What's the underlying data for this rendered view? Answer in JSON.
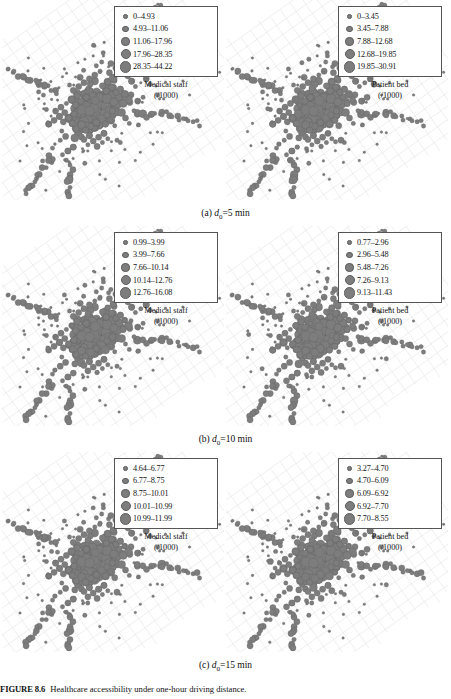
{
  "figure": {
    "number_label": "FIGURE 8.6",
    "caption_text": "Healthcare accessibility under one-hour driving distance.",
    "panel_rows": [
      {
        "subcaption_prefix": "(a)",
        "subcaption_var": "d",
        "subcaption_sub": "0",
        "subcaption_value": "=5 min",
        "panels": [
          {
            "variable": "Medical staff",
            "unit": "(/1000)",
            "classes": [
              {
                "label": "0–4.93",
                "size": 2.6
              },
              {
                "label": "4.93–11.06",
                "size": 4.4
              },
              {
                "label": "11.06–17.96",
                "size": 6.2
              },
              {
                "label": "17.96–28.35",
                "size": 8.0
              },
              {
                "label": "28.35–44.22",
                "size": 9.8
              }
            ]
          },
          {
            "variable": "Patient bed",
            "unit": "(/1000)",
            "classes": [
              {
                "label": "0–3.45",
                "size": 2.6
              },
              {
                "label": "3.45–7.88",
                "size": 4.4
              },
              {
                "label": "7.88–12.68",
                "size": 6.2
              },
              {
                "label": "12.68–19.85",
                "size": 8.0
              },
              {
                "label": "19.85–30.91",
                "size": 9.8
              }
            ]
          }
        ]
      },
      {
        "subcaption_prefix": "(b)",
        "subcaption_var": "d",
        "subcaption_sub": "0",
        "subcaption_value": "=10 min",
        "panels": [
          {
            "variable": "Medical staff",
            "unit": "(/1000)",
            "classes": [
              {
                "label": "0.99–3.99",
                "size": 2.6
              },
              {
                "label": "3.99–7.66",
                "size": 4.4
              },
              {
                "label": "7.66–10.14",
                "size": 6.2
              },
              {
                "label": "10.14–12.76",
                "size": 8.0
              },
              {
                "label": "12.76–16.08",
                "size": 9.8
              }
            ]
          },
          {
            "variable": "Patient bed",
            "unit": "(/1000)",
            "classes": [
              {
                "label": "0.77–2.96",
                "size": 2.6
              },
              {
                "label": "2.96–5.48",
                "size": 4.4
              },
              {
                "label": "5.48–7.26",
                "size": 6.2
              },
              {
                "label": "7.26–9.13",
                "size": 8.0
              },
              {
                "label": "9.13–11.43",
                "size": 9.8
              }
            ]
          }
        ]
      },
      {
        "subcaption_prefix": "(c)",
        "subcaption_var": "d",
        "subcaption_sub": "0",
        "subcaption_value": "=15 min",
        "panels": [
          {
            "variable": "Medical staff",
            "unit": "(/1000)",
            "classes": [
              {
                "label": "4.64–6.77",
                "size": 2.6
              },
              {
                "label": "6.77–8.75",
                "size": 4.4
              },
              {
                "label": "8.75–10.01",
                "size": 6.2
              },
              {
                "label": "10.01–10.99",
                "size": 8.0
              },
              {
                "label": "10.99–11.99",
                "size": 9.8
              }
            ]
          },
          {
            "variable": "Patient bed",
            "unit": "(/1000)",
            "classes": [
              {
                "label": "3.27–4.70",
                "size": 2.6
              },
              {
                "label": "4.70–6.09",
                "size": 4.4
              },
              {
                "label": "6.09–6.92",
                "size": 6.2
              },
              {
                "label": "6.92–7.70",
                "size": 8.0
              },
              {
                "label": "7.70–8.55",
                "size": 9.8
              }
            ]
          }
        ]
      }
    ]
  },
  "chart_data": {
    "type": "scatter",
    "title": "Healthcare accessibility under one-hour driving distance.",
    "xlabel": "",
    "ylabel": "",
    "grid": false,
    "legend_position": "top-right inside panel",
    "marker_color": "#7d7d7d",
    "basemap_color": "#d7d7d7",
    "symbol_sizes_px": [
      2.6,
      4.4,
      6.2,
      8.0,
      9.8
    ],
    "panels": [
      {
        "row": "(a) d0=5 min",
        "column": "Medical staff",
        "series_name": "Medical staff (/1000)",
        "class_breaks": [
          0,
          4.93,
          11.06,
          17.96,
          28.35,
          44.22
        ],
        "class_labels": [
          "0–4.93",
          "4.93–11.06",
          "11.06–17.96",
          "17.96–28.35",
          "28.35–44.22"
        ]
      },
      {
        "row": "(a) d0=5 min",
        "column": "Patient bed",
        "series_name": "Patient bed (/1000)",
        "class_breaks": [
          0,
          3.45,
          7.88,
          12.68,
          19.85,
          30.91
        ],
        "class_labels": [
          "0–3.45",
          "3.45–7.88",
          "7.88–12.68",
          "12.68–19.85",
          "19.85–30.91"
        ]
      },
      {
        "row": "(b) d0=10 min",
        "column": "Medical staff",
        "series_name": "Medical staff (/1000)",
        "class_breaks": [
          0.99,
          3.99,
          7.66,
          10.14,
          12.76,
          16.08
        ],
        "class_labels": [
          "0.99–3.99",
          "3.99–7.66",
          "7.66–10.14",
          "10.14–12.76",
          "12.76–16.08"
        ]
      },
      {
        "row": "(b) d0=10 min",
        "column": "Patient bed",
        "series_name": "Patient bed (/1000)",
        "class_breaks": [
          0.77,
          2.96,
          5.48,
          7.26,
          9.13,
          11.43
        ],
        "class_labels": [
          "0.77–2.96",
          "2.96–5.48",
          "5.48–7.26",
          "7.26–9.13",
          "9.13–11.43"
        ]
      },
      {
        "row": "(c) d0=15 min",
        "column": "Medical staff",
        "series_name": "Medical staff (/1000)",
        "class_breaks": [
          4.64,
          6.77,
          8.75,
          10.01,
          10.99,
          11.99
        ],
        "class_labels": [
          "4.64–6.77",
          "6.77–8.75",
          "8.75–10.01",
          "10.01–10.99",
          "10.99–11.99"
        ]
      },
      {
        "row": "(c) d0=15 min",
        "column": "Patient bed",
        "series_name": "Patient bed (/1000)",
        "class_breaks": [
          3.27,
          4.7,
          6.09,
          6.92,
          7.7,
          8.55
        ],
        "class_labels": [
          "3.27–4.70",
          "4.70–6.09",
          "6.09–6.92",
          "6.92–7.70",
          "7.70–8.55"
        ]
      }
    ]
  }
}
